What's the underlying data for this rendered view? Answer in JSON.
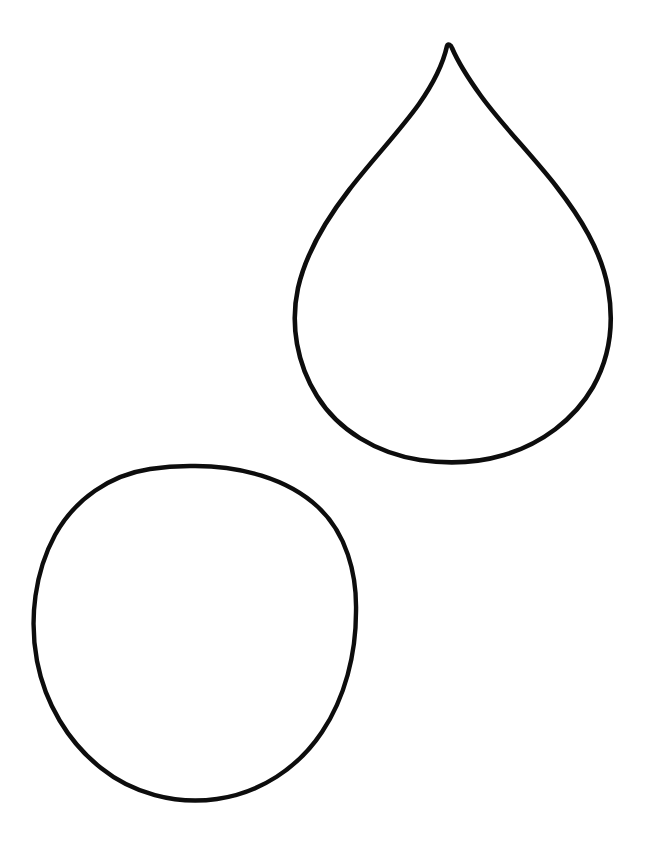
{
  "canvas": {
    "width": 655,
    "height": 847,
    "background_color": "#ffffff",
    "title": "Teardrop and Circle Outline Drawing",
    "style": "black line-art outline, coloring-page style, hand-drawn",
    "stroke_color": "#0d0d0d"
  },
  "shapes": [
    {
      "id": "teardrop",
      "name": "teardrop",
      "label": "Teardrop",
      "stroke_color": "#0d0d0d",
      "stroke_width": 4.6,
      "fill": "none",
      "bbox": {
        "x": 293,
        "y": 44,
        "width": 319,
        "height": 420
      },
      "geometry": {
        "tip": [
          447,
          46
        ],
        "left_extreme": [
          295,
          295
        ],
        "right_extreme": [
          610,
          288
        ],
        "bottom": [
          455,
          462
        ],
        "widest_width": 315
      },
      "path": "M 447 46 C 443 64 433 84 419 104 C 399 132 372 160 349 190 C 325 221 306 253 298 288 C 290 325 297 364 317 396 C 338 430 376 453 420 460 C 447 464 477 463 504 455 C 541 444 574 420 593 387 C 610 357 614 322 608 288 C 601 250 580 217 556 186 C 531 154 502 125 481 96 C 468 78 458 62 452 48 C 451 45 448 43 447 46 Z"
    },
    {
      "id": "circle",
      "name": "circle",
      "label": "Circle",
      "stroke_color": "#0d0d0d",
      "stroke_width": 4.4,
      "fill": "none",
      "bbox": {
        "x": 33,
        "y": 464,
        "width": 325,
        "height": 338
      },
      "geometry": {
        "center": [
          195,
          633
        ],
        "radius_x": 161,
        "radius_y": 167,
        "top": [
          190,
          466
        ],
        "bottom": [
          198,
          800
        ],
        "left": [
          34,
          627
        ],
        "right": [
          356,
          639
        ]
      },
      "path": "M 190 466 C 240 465 288 479 318 507 C 346 533 357 573 356 612 C 356 654 345 698 322 732 C 298 768 260 793 217 799 C 175 805 132 793 101 768 C 68 742 45 703 37 661 C 29 618 35 572 55 535 C 75 499 110 475 150 469 C 163 467 177 466 190 466 Z"
    }
  ]
}
